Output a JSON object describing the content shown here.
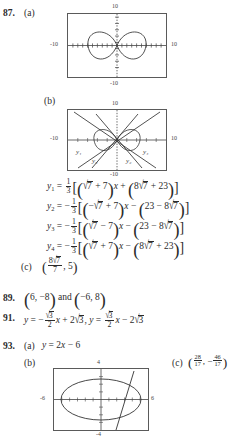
{
  "page": {
    "kind": "answer-key",
    "text_color": "#2b2b2b",
    "screen_border_color": "#5a5a5a"
  },
  "exercises": [
    {
      "number": "87.",
      "parts": [
        {
          "label": "(a)",
          "type": "graph"
        },
        {
          "label": "(b)",
          "type": "graph"
        },
        {
          "label": "(c)",
          "type": "point",
          "value": "(8√7/7, 5)"
        }
      ],
      "equations": [
        {
          "lhs": "y₁",
          "rhs": "⅓[(√7 + 7)x + (8√7 + 23)]"
        },
        {
          "lhs": "y₂",
          "rhs": "−⅓[(−√7 + 7)x − (23 − 8√7)]"
        },
        {
          "lhs": "y₃",
          "rhs": "−⅓[(√7 − 7)x − (23 − 8√7)]"
        },
        {
          "lhs": "y₄",
          "rhs": "−⅓[(√7 + 7)x − (8√7 + 23)]"
        }
      ]
    },
    {
      "number": "89.",
      "answer": "(6, −8) and (−6, 8)"
    },
    {
      "number": "91.",
      "answer": "y = −(√3/2)x + 2√3, y = (√3/2)x − 2√3"
    },
    {
      "number": "93.",
      "parts": [
        {
          "label": "(a)",
          "type": "equation",
          "value": "y = 2x − 6"
        },
        {
          "label": "(b)",
          "type": "graph"
        },
        {
          "label": "(c)",
          "type": "point",
          "value": "(28/17, −46/17)"
        }
      ]
    }
  ],
  "graph_87a": {
    "xmin": "-10",
    "xmax": "10",
    "ymin": "-10",
    "ymax": "10",
    "tick_top": "10",
    "tick_bottom": "-10",
    "tick_left": "-10",
    "tick_right": "10",
    "curve": "four-petal rose (two horizontal lobes)"
  },
  "graph_87b": {
    "xmin": "-10",
    "xmax": "10",
    "ymin": "-10",
    "ymax": "10",
    "tick_top": "10",
    "tick_bottom": "-10",
    "tick_left": "-10",
    "tick_right": "10",
    "curve_labels": [
      "y₁",
      "y₃",
      "y₂",
      "y₄"
    ]
  },
  "graph_93b": {
    "xmin": "-6",
    "xmax": "6",
    "ymin": "-4",
    "ymax": "4",
    "tick_top": "4",
    "tick_bottom": "-4",
    "tick_left": "-6",
    "tick_right": "6",
    "curve": "ellipse with intersecting line"
  },
  "math_87": {
    "third": "1",
    "third_den": "3",
    "seven": "7",
    "eight": "8",
    "twentythree": "23",
    "x": "x"
  },
  "math_93c": {
    "num1": "28",
    "den1": "17",
    "num2": "46",
    "den2": "17"
  },
  "math_87c": {
    "num": "8",
    "den": "7",
    "radicand": "7",
    "second": "5"
  },
  "math_91": {
    "radicand": "3",
    "den": "2",
    "coef": "2"
  }
}
